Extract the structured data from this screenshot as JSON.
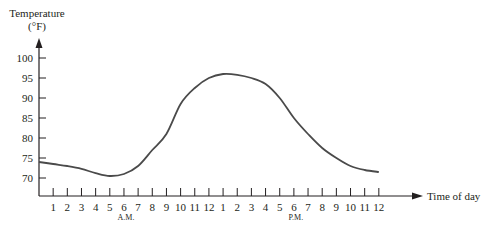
{
  "chart_data": {
    "type": "line",
    "title": "",
    "ylabel": "Temperature",
    "ylabel_unit": "(°F)",
    "xlabel": "Time of day",
    "ylim": [
      66,
      102
    ],
    "y_ticks": [
      70,
      75,
      80,
      85,
      90,
      95,
      100
    ],
    "x_tick_labels": [
      "1",
      "2",
      "3",
      "4",
      "5",
      "6",
      "7",
      "8",
      "9",
      "10",
      "11",
      "12",
      "1",
      "2",
      "3",
      "4",
      "5",
      "6",
      "7",
      "8",
      "9",
      "10",
      "11",
      "12"
    ],
    "x_period_labels": [
      {
        "label": "A.M.",
        "under_tick_index": 5
      },
      {
        "label": "P.M.",
        "under_tick_index": 17
      }
    ],
    "grid": false,
    "legend": null,
    "series": [
      {
        "name": "Temperature",
        "x_hours": [
          0,
          1,
          2,
          3,
          4,
          5,
          6,
          7,
          8,
          9,
          10,
          11,
          12,
          13,
          14,
          15,
          16,
          17,
          18,
          19,
          20,
          21,
          22,
          23,
          24
        ],
        "values": [
          74,
          73.5,
          73,
          72.3,
          71.2,
          70.5,
          71,
          73,
          77,
          81,
          88.5,
          92.5,
          95,
          96,
          95.8,
          95,
          93.5,
          90,
          85,
          81,
          77.5,
          75,
          73,
          72,
          71.5
        ]
      }
    ]
  },
  "axis": {
    "y_title_line1": "Temperature",
    "y_title_line2": "(°F)",
    "x_title": "Time of day",
    "am_label": "A.M.",
    "pm_label": "P.M."
  }
}
